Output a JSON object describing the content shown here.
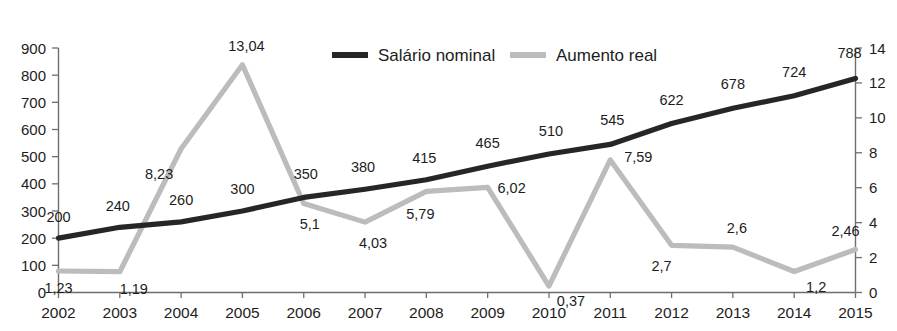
{
  "chart_data": {
    "type": "line",
    "title": "",
    "xlabel": "",
    "categories": [
      "2002",
      "2003",
      "2004",
      "2005",
      "2006",
      "2007",
      "2008",
      "2009",
      "2010",
      "2011",
      "2012",
      "2013",
      "2014",
      "2015"
    ],
    "grid": false,
    "legend_position": "top-center",
    "axes": {
      "left": {
        "label": "",
        "ylim": [
          0,
          900
        ],
        "tick_step": 100,
        "ticks": [
          "0",
          "100",
          "200",
          "300",
          "400",
          "500",
          "600",
          "700",
          "800",
          "900"
        ],
        "series": "Salário nominal"
      },
      "right": {
        "label": "",
        "ylim": [
          0,
          14
        ],
        "tick_step": 2,
        "ticks": [
          "0",
          "2",
          "4",
          "6",
          "8",
          "10",
          "12",
          "14"
        ],
        "series": "Aumento real"
      }
    },
    "series": [
      {
        "name": "Salário nominal",
        "axis": "left",
        "color": "#262626",
        "values": [
          200,
          240,
          260,
          300,
          350,
          380,
          415,
          465,
          510,
          545,
          622,
          678,
          724,
          788
        ],
        "labels": [
          "200",
          "240",
          "260",
          "300",
          "350",
          "380",
          "415",
          "465",
          "510",
          "545",
          "622",
          "678",
          "724",
          "788"
        ],
        "label_offsets": [
          {
            "dx": 0,
            "dy": -16
          },
          {
            "dx": -2,
            "dy": -16
          },
          {
            "dx": 0,
            "dy": -17
          },
          {
            "dx": 0,
            "dy": -17
          },
          {
            "dx": 2,
            "dy": -18
          },
          {
            "dx": -2,
            "dy": -17
          },
          {
            "dx": -2,
            "dy": -17
          },
          {
            "dx": 0,
            "dy": -18
          },
          {
            "dx": 2,
            "dy": -18
          },
          {
            "dx": 2,
            "dy": -19
          },
          {
            "dx": 0,
            "dy": -19
          },
          {
            "dx": 0,
            "dy": -19
          },
          {
            "dx": 0,
            "dy": -19
          },
          {
            "dx": -6,
            "dy": -20
          }
        ]
      },
      {
        "name": "Aumento real",
        "axis": "right",
        "color": "#bcbcbc",
        "values": [
          1.23,
          1.19,
          8.23,
          13.04,
          5.1,
          4.03,
          5.79,
          6.02,
          0.37,
          7.59,
          2.7,
          2.6,
          1.2,
          2.46
        ],
        "labels": [
          "1,23",
          "1,19",
          "8,23",
          "13,04",
          "5,1",
          "4,03",
          "5,79",
          "6,02",
          "0,37",
          "7,59",
          "2,7",
          "2,6",
          "1,2",
          "2,46"
        ],
        "label_offsets": [
          {
            "dx": 0,
            "dy": 22
          },
          {
            "dx": 14,
            "dy": 22
          },
          {
            "dx": -22,
            "dy": 30
          },
          {
            "dx": 4,
            "dy": -14
          },
          {
            "dx": 6,
            "dy": 26
          },
          {
            "dx": 8,
            "dy": 26
          },
          {
            "dx": -6,
            "dy": 28
          },
          {
            "dx": 24,
            "dy": 6
          },
          {
            "dx": 22,
            "dy": 20
          },
          {
            "dx": 28,
            "dy": 2
          },
          {
            "dx": -10,
            "dy": 26
          },
          {
            "dx": 4,
            "dy": -14
          },
          {
            "dx": 22,
            "dy": 20
          },
          {
            "dx": -10,
            "dy": -14
          }
        ]
      }
    ],
    "legend": [
      {
        "label": "Salário nominal",
        "color": "#262626"
      },
      {
        "label": "Aumento real",
        "color": "#bcbcbc"
      }
    ]
  }
}
